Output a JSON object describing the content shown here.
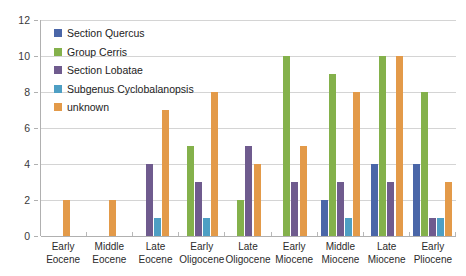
{
  "chart_data": {
    "type": "bar",
    "title": "",
    "xlabel": "",
    "ylabel": "",
    "ylim": [
      0,
      12
    ],
    "yticks": [
      0,
      2,
      4,
      6,
      8,
      10,
      12
    ],
    "grid": true,
    "legend_position": "top-left",
    "categories": [
      "Early Eocene",
      "Middle Eocene",
      "Late Eocene",
      "Early Oligocene",
      "Late Oligocene",
      "Early Miocene",
      "Middle Miocene",
      "Late Miocene",
      "Early Pliocene"
    ],
    "category_lines": [
      [
        "Early",
        "Eocene"
      ],
      [
        "Middle",
        "Eocene"
      ],
      [
        "Late",
        "Eocene"
      ],
      [
        "Early",
        "Oligocene"
      ],
      [
        "Late",
        "Oligocene"
      ],
      [
        "Early",
        "Miocene"
      ],
      [
        "Middle",
        "Miocene"
      ],
      [
        "Late",
        "Miocene"
      ],
      [
        "Early",
        "Pliocene"
      ]
    ],
    "series": [
      {
        "name": "Section Quercus",
        "color": "#4a66a8",
        "values": [
          0,
          0,
          0,
          0,
          0,
          0,
          2,
          4,
          4
        ]
      },
      {
        "name": "Group Cerris",
        "color": "#84b14b",
        "values": [
          0,
          0,
          0,
          5,
          2,
          10,
          9,
          10,
          8
        ]
      },
      {
        "name": "Section Lobatae",
        "color": "#6f5b8e",
        "values": [
          0,
          0,
          4,
          3,
          5,
          3,
          3,
          3,
          1
        ]
      },
      {
        "name": "Subgenus Cyclobalanopsis",
        "color": "#4e9fc4",
        "values": [
          0,
          0,
          1,
          1,
          0,
          0,
          1,
          0,
          1
        ]
      },
      {
        "name": "unknown",
        "color": "#e39a49",
        "values": [
          2,
          2,
          7,
          8,
          4,
          5,
          8,
          10,
          3
        ]
      }
    ]
  },
  "axis": {
    "y_tick_labels": [
      "0",
      "2",
      "4",
      "6",
      "8",
      "10",
      "12"
    ]
  }
}
